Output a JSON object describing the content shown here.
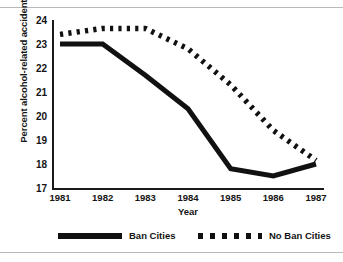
{
  "chart_data": {
    "type": "line",
    "title": "",
    "xlabel": "Year",
    "ylabel": "Percent alcohol-related accidents",
    "categories": [
      "1981",
      "1982",
      "1983",
      "1984",
      "1985",
      "1986",
      "1987"
    ],
    "x": [
      1981,
      1982,
      1983,
      1984,
      1985,
      1986,
      1987
    ],
    "xlim": [
      1981,
      1987
    ],
    "ylim": [
      17,
      24
    ],
    "yticks": [
      17,
      18,
      19,
      20,
      21,
      22,
      23,
      24
    ],
    "ytick_labels": [
      "17",
      "18",
      "19",
      "20",
      "21",
      "22",
      "23",
      "24"
    ],
    "grid": false,
    "legend_position": "bottom",
    "series": [
      {
        "name": "Ban Cities",
        "style": "solid",
        "color": "#111111",
        "values": [
          23.0,
          23.0,
          21.7,
          20.3,
          17.8,
          17.5,
          18.0
        ]
      },
      {
        "name": "No Ban Cities",
        "style": "dotted",
        "color": "#111111",
        "values": [
          23.4,
          23.65,
          23.65,
          22.8,
          21.3,
          19.4,
          18.15
        ]
      }
    ]
  },
  "legend": {
    "items": [
      {
        "label": "Ban Cities",
        "swatch": "solid-line-swatch"
      },
      {
        "label": "No Ban Cities",
        "swatch": "dotted-line-swatch"
      }
    ]
  }
}
